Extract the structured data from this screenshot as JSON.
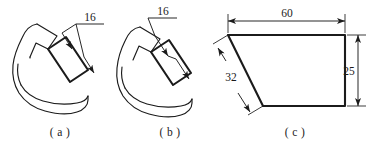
{
  "sheet": {
    "title": "Engineering dimensioning examples",
    "background_color": "#ffffff",
    "ink_color": "#1b1b1b"
  },
  "figures": [
    {
      "id": "a",
      "caption": "( a )",
      "description": "Irregular blob outline with an inset rectangle; width dimension placed with a leader outside the part.",
      "dimensions": [
        {
          "name": "rectangle-width",
          "value": "16",
          "placement": "leader-outside",
          "arrows": 2
        }
      ]
    },
    {
      "id": "b",
      "caption": "( b )",
      "description": "Same irregular blob outline with inset rectangle; dimension line drawn across the rectangle with a leader above.",
      "dimensions": [
        {
          "name": "rectangle-width",
          "value": "16",
          "placement": "leader-above",
          "arrows": 2
        }
      ]
    },
    {
      "id": "c",
      "caption": "( c )",
      "description": "Quadrilateral plate with horizontal overall length, slanted edge length and vertical height dimensions.",
      "dimensions": [
        {
          "name": "overall-length",
          "value": "60",
          "placement": "above-horizontal",
          "arrows": 2
        },
        {
          "name": "slant-edge-length",
          "value": "32",
          "placement": "left-parallel",
          "arrows": 2
        },
        {
          "name": "overall-height",
          "value": "25",
          "placement": "right-vertical",
          "arrows": 2
        }
      ]
    }
  ]
}
